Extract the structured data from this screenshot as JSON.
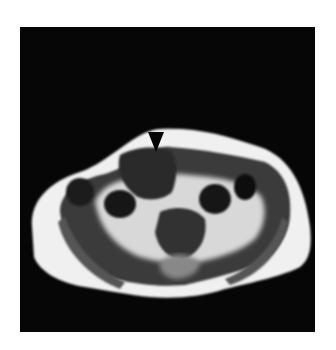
{
  "figure": {
    "type": "axial MRI pelvis",
    "annotation": "arrowhead",
    "colors": {
      "background": "#ffffff",
      "frame": "#060606",
      "fat": "#f2f2f2",
      "muscle": "#3a3a3a",
      "dark": "#111111"
    }
  }
}
